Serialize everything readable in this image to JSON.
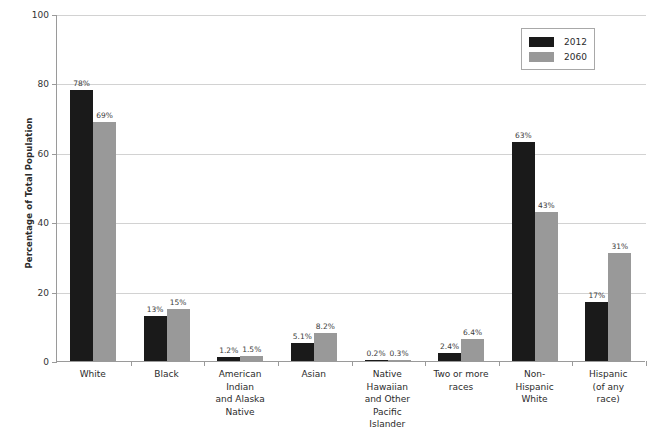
{
  "chart_data": {
    "type": "bar",
    "title": "",
    "subtitle": "",
    "xlabel": "",
    "ylabel": "Percentage of Total Population",
    "ylim": [
      0,
      100
    ],
    "ytick_labels": [
      "0",
      "20",
      "40",
      "60",
      "80",
      "100"
    ],
    "ytick_values": [
      0,
      20,
      40,
      60,
      80,
      100
    ],
    "grid": "horizontal",
    "legend_position": "top-right",
    "categories": [
      "White",
      "Black",
      "American\nIndian\nand Alaska\nNative",
      "Asian",
      "Native\nHawaiian\nand Other\nPacific\nIslander",
      "Two or more\nraces",
      "Non-\nHispanic\nWhite",
      "Hispanic\n(of any\nrace)"
    ],
    "category_lines": [
      [
        "White"
      ],
      [
        "Black"
      ],
      [
        "American",
        "Indian",
        "and Alaska",
        "Native"
      ],
      [
        "Asian"
      ],
      [
        "Native",
        "Hawaiian",
        "and Other",
        "Pacific",
        "Islander"
      ],
      [
        "Two or more",
        "races"
      ],
      [
        "Non-",
        "Hispanic",
        "White"
      ],
      [
        "Hispanic",
        "(of any",
        "race)"
      ]
    ],
    "series": [
      {
        "name": "2012",
        "color": "#1a1a1a",
        "values": [
          78,
          13,
          1.2,
          5.1,
          0.2,
          2.4,
          63,
          17
        ],
        "labels": [
          "78%",
          "13%",
          "1.2%",
          "5.1%",
          "0.2%",
          "2.4%",
          "63%",
          "17%"
        ]
      },
      {
        "name": "2060",
        "color": "#999999",
        "values": [
          69,
          15,
          1.5,
          8.2,
          0.3,
          6.4,
          43,
          31
        ],
        "labels": [
          "69%",
          "15%",
          "1.5%",
          "8.2%",
          "0.3%",
          "6.4%",
          "43%",
          "31%"
        ]
      }
    ]
  },
  "legend": {
    "items": [
      {
        "label": "2012",
        "color": "#1a1a1a"
      },
      {
        "label": "2060",
        "color": "#999999"
      }
    ]
  },
  "axes": {
    "y_title": "Percentage of Total Population"
  }
}
